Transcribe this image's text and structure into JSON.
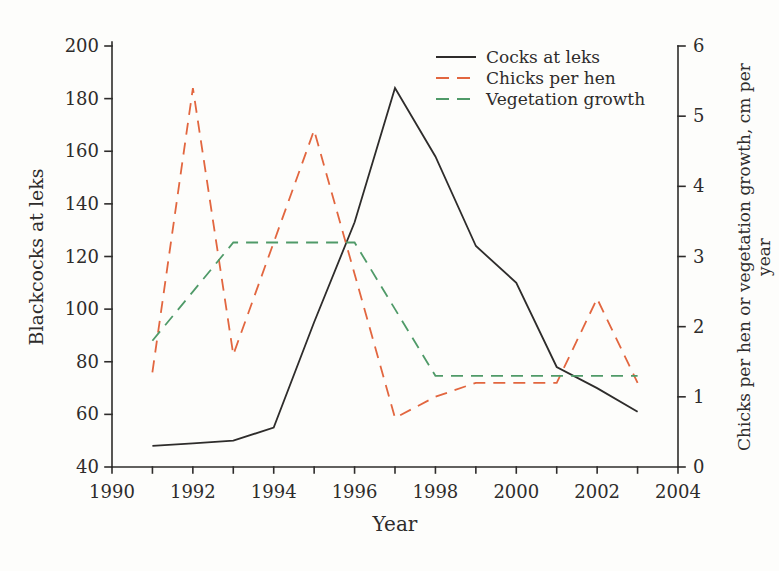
{
  "figure": {
    "background": "#fdfdfb"
  },
  "chart_data": {
    "type": "line",
    "title": "",
    "xlabel": "Year",
    "ylabel_left": "Blackcocks at leks",
    "ylabel_right": "Chicks per hen or vegetation growth, cm per year",
    "xlim": [
      1990,
      2004
    ],
    "ylim_left": [
      40,
      200
    ],
    "ylim_right": [
      0,
      6
    ],
    "x_major_ticks": [
      1990,
      1992,
      1994,
      1996,
      1998,
      2000,
      2002,
      2004
    ],
    "y_ticks_left": [
      40,
      60,
      80,
      100,
      120,
      140,
      160,
      180,
      200
    ],
    "y_ticks_right": [
      0,
      1,
      2,
      3,
      4,
      5,
      6
    ],
    "grid": "off",
    "legend_position": "upper-center-right",
    "axis_color": "#2e2c2b",
    "x": [
      1991,
      1992,
      1993,
      1994,
      1995,
      1996,
      1997,
      1998,
      1999,
      2000,
      2001,
      2002,
      2003
    ],
    "series": [
      {
        "name": "Cocks at leks",
        "axis": "left",
        "color": "#2e2c2b",
        "style": "solid",
        "values": [
          48,
          49,
          50,
          55,
          95,
          133,
          184,
          158,
          124,
          110,
          78,
          70,
          61
        ]
      },
      {
        "name": "Chicks per hen",
        "axis": "right",
        "color": "#e2663f",
        "style": "dashed",
        "values": [
          1.35,
          5.4,
          1.6,
          3.2,
          4.8,
          2.75,
          0.7,
          1.0,
          1.2,
          1.2,
          1.2,
          2.4,
          1.2
        ]
      },
      {
        "name": "Vegetation growth",
        "axis": "right",
        "color": "#4f9a68",
        "style": "dashed",
        "values": [
          1.8,
          2.5,
          3.2,
          3.2,
          3.2,
          3.2,
          2.25,
          1.3,
          1.3,
          1.3,
          1.3,
          1.3,
          1.3
        ]
      }
    ]
  }
}
